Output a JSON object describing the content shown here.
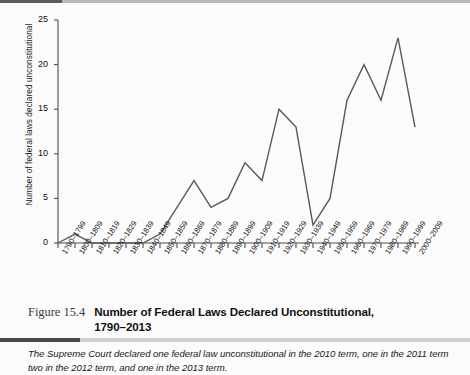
{
  "figure": {
    "number_label": "Figure 15.4",
    "title_line1": "Number of Federal Laws Declared Unconstitutional,",
    "title_line2": "1790–2013",
    "footnote": "The Supreme Court declared one federal law unconstitutional in the 2010 term, one in the 2011 term two in the 2012 term, and one in the 2013 term."
  },
  "colors": {
    "line": "#595959",
    "axis": "#4d4d4d",
    "page_bg": "#fbfbfb",
    "rule_light": "#c9c9c9",
    "rule_dark": "#4a4a4a"
  },
  "chart_data": {
    "type": "line",
    "title": "Number of Federal Laws Declared Unconstitutional, 1790–2013",
    "xlabel": "",
    "ylabel": "Number of federal laws declared unconstitutional",
    "ylim": [
      0,
      25
    ],
    "yticks": [
      0,
      5,
      10,
      15,
      20,
      25
    ],
    "grid": false,
    "legend": "none",
    "categories": [
      "1790–1799",
      "1800–1809",
      "1810–1819",
      "1820–1829",
      "1830–1839",
      "1840–1849",
      "1850–1859",
      "1860–1869",
      "1870–1879",
      "1880–1889",
      "1890–1899",
      "1900–1909",
      "1910–1919",
      "1920–1929",
      "1930–1939",
      "1940–1949",
      "1950–1959",
      "1960–1969",
      "1970–1979",
      "1980–1989",
      "1990–1999",
      "2000–2009"
    ],
    "values": [
      0,
      1,
      0,
      0,
      0,
      0,
      1,
      4,
      7,
      4,
      5,
      9,
      7,
      15,
      13,
      2,
      5,
      16,
      20,
      16,
      23,
      13
    ]
  }
}
